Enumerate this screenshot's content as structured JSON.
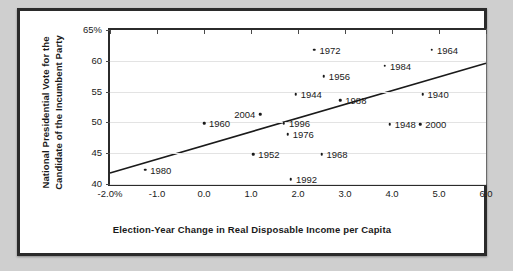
{
  "chart_data": {
    "type": "scatter",
    "title": "",
    "xlabel": "Election-Year Change in Real Disposable Income per Capita",
    "ylabel_line1": "National Presidential Vote for the",
    "ylabel_line2": "Candidate of the Incumbent Party",
    "xlim": [
      -2.0,
      6.0
    ],
    "ylim": [
      40,
      65
    ],
    "xticks": [
      "-2.0%",
      "-1.0",
      "0.0",
      "1.0",
      "2.0",
      "3.0",
      "4.0",
      "5.0",
      "6.0"
    ],
    "xtick_values": [
      -2.0,
      -1.0,
      0.0,
      1.0,
      2.0,
      3.0,
      4.0,
      5.0,
      6.0
    ],
    "yticks": [
      "65%",
      "60",
      "55",
      "50",
      "45",
      "40"
    ],
    "ytick_values": [
      65,
      60,
      55,
      50,
      45,
      40
    ],
    "grid": "horizontal",
    "legend": "none",
    "point_color": "#1a1a1a",
    "line_color": "#1a1a1a",
    "points": [
      {
        "label": "1972",
        "x": 2.35,
        "y": 61.8,
        "label_side": "right"
      },
      {
        "label": "1964",
        "x": 4.85,
        "y": 61.8,
        "label_side": "right"
      },
      {
        "label": "1984",
        "x": 3.85,
        "y": 59.2,
        "label_side": "right"
      },
      {
        "label": "1956",
        "x": 2.55,
        "y": 57.5,
        "label_side": "right"
      },
      {
        "label": "1944",
        "x": 1.95,
        "y": 54.6,
        "label_side": "right"
      },
      {
        "label": "1940",
        "x": 4.65,
        "y": 54.6,
        "label_side": "right"
      },
      {
        "label": "1988",
        "x": 2.9,
        "y": 53.6,
        "label_side": "right"
      },
      {
        "label": "2004",
        "x": 1.2,
        "y": 51.3,
        "label_side": "left"
      },
      {
        "label": "1960",
        "x": 0.0,
        "y": 49.9,
        "label_side": "right"
      },
      {
        "label": "1996",
        "x": 1.7,
        "y": 49.9,
        "label_side": "right"
      },
      {
        "label": "1948",
        "x": 3.95,
        "y": 49.7,
        "label_side": "right"
      },
      {
        "label": "2000",
        "x": 4.6,
        "y": 49.7,
        "label_side": "right"
      },
      {
        "label": "1976",
        "x": 1.78,
        "y": 48.1,
        "label_side": "right"
      },
      {
        "label": "1952",
        "x": 1.05,
        "y": 44.8,
        "label_side": "right"
      },
      {
        "label": "1968",
        "x": 2.5,
        "y": 44.8,
        "label_side": "right"
      },
      {
        "label": "1980",
        "x": -1.25,
        "y": 42.3,
        "label_side": "right"
      },
      {
        "label": "1992",
        "x": 1.85,
        "y": 40.8,
        "label_side": "right"
      }
    ],
    "trendline": {
      "x1": -2.0,
      "y1": 41.8,
      "x2": 6.0,
      "y2": 59.6
    }
  }
}
